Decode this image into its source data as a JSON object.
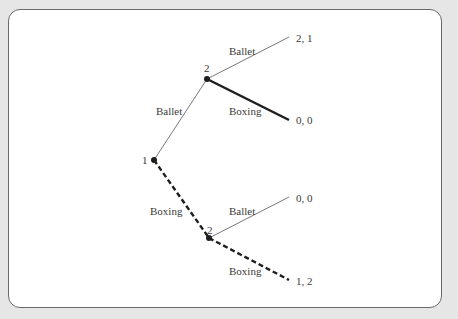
{
  "figure": {
    "title": "",
    "players": [
      "1",
      "2"
    ],
    "nodes": [
      {
        "id": "root",
        "player": "1",
        "label": "1",
        "x": 154,
        "y": 160
      },
      {
        "id": "upper",
        "player": "2",
        "label": "2",
        "x": 207,
        "y": 79
      },
      {
        "id": "lower",
        "player": "2",
        "label": "2",
        "x": 209,
        "y": 238
      }
    ],
    "edges": [
      {
        "from": "root",
        "to": "upper",
        "label": "Ballet",
        "style": "thin"
      },
      {
        "from": "root",
        "to": "lower",
        "label": "Boxing",
        "style": "dashed"
      },
      {
        "from": "upper",
        "to": "t1",
        "label": "Ballet",
        "style": "thin"
      },
      {
        "from": "upper",
        "to": "t2",
        "label": "Boxing",
        "style": "thick"
      },
      {
        "from": "lower",
        "to": "t3",
        "label": "Ballet",
        "style": "thin"
      },
      {
        "from": "lower",
        "to": "t4",
        "label": "Boxing",
        "style": "dashed"
      }
    ],
    "terminals": [
      {
        "id": "t1",
        "payoff": "2, 1"
      },
      {
        "id": "t2",
        "payoff": "0, 0"
      },
      {
        "id": "t3",
        "payoff": "0, 0"
      },
      {
        "id": "t4",
        "payoff": "1, 2"
      }
    ],
    "labels": {
      "root_player": "1",
      "upper_player": "2",
      "lower_player": "2",
      "root_to_upper": "Ballet",
      "root_to_lower": "Boxing",
      "upper_ballet": "Ballet",
      "upper_boxing": "Boxing",
      "lower_ballet": "Ballet",
      "lower_boxing": "Boxing",
      "payoff_1": "2, 1",
      "payoff_2": "0, 0",
      "payoff_3": "0, 0",
      "payoff_4": "1, 2"
    },
    "colors": {
      "background": "#e6e6e6",
      "panel": "#ffffff",
      "border": "#6a6a6a",
      "line": "#1e1e1e",
      "text": "#3a3a3a"
    }
  }
}
